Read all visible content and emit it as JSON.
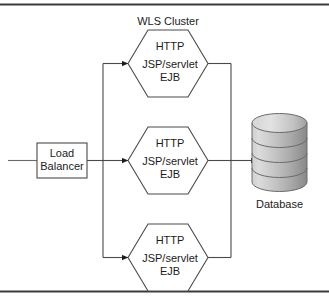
{
  "figure": {
    "cluster_title": "WLS Cluster",
    "top_rule": true,
    "bottom_rule": true
  },
  "load_balancer": {
    "line1": "Load",
    "line2": "Balancer"
  },
  "cluster_nodes": [
    {
      "line1": "HTTP",
      "line2": "JSP/servlet",
      "line3": "EJB"
    },
    {
      "line1": "HTTP",
      "line2": "JSP/servlet",
      "line3": "EJB"
    },
    {
      "line1": "HTTP",
      "line2": "JSP/servlet",
      "line3": "EJB"
    }
  ],
  "database": {
    "caption": "Database",
    "disc_count": 4
  },
  "colors": {
    "stroke": "#4a4a4a",
    "text": "#1c1c1c",
    "rule": "#3a3a3a",
    "shape_fill": "#ffffff",
    "db_light": "#dcdcdc",
    "db_mid": "#b4b4b4",
    "db_dark": "#8a8a8a",
    "db_outline": "#6b6b6b"
  }
}
